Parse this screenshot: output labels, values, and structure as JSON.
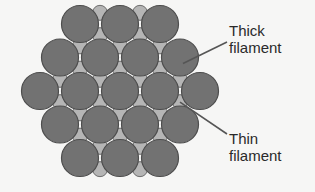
{
  "diagram": {
    "labels": {
      "thick": "Thick\nfilament",
      "thin": "Thin\nfilament"
    },
    "colors": {
      "thick_fill": "#727272",
      "thick_stroke": "#4d4d4d",
      "thin_fill": "#b5b5b5",
      "thin_stroke": "#6e6e6e",
      "pointer": "#555555",
      "text": "#2a2a2a",
      "background": "#f6f6f5"
    },
    "lattice": {
      "arrangement": "hexagonal",
      "thick_row_counts": [
        3,
        4,
        5,
        4,
        3
      ],
      "thick_count": 19,
      "thin_per_thick_ratio": 2
    },
    "callouts": [
      {
        "target": "thick",
        "label_key": "thick"
      },
      {
        "target": "thin",
        "label_key": "thin"
      }
    ]
  }
}
